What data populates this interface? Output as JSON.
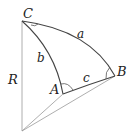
{
  "diagram": {
    "type": "spherical-triangle",
    "vertices": {
      "A": "A",
      "B": "B",
      "C": "C"
    },
    "sides": {
      "a": "a",
      "b": "b",
      "c": "c"
    },
    "radius_label": "R",
    "colors": {
      "stroke": "#444444",
      "thin_stroke": "#888888",
      "text": "#222222"
    }
  }
}
